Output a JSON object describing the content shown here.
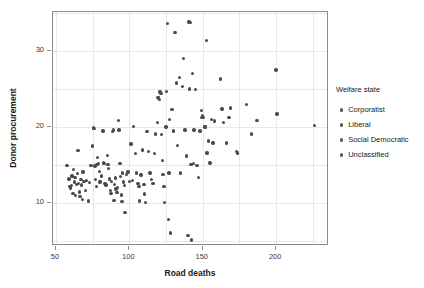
{
  "chart_data": {
    "type": "scatter",
    "title": "",
    "xlabel": "Road deaths",
    "ylabel": "Donor procurement",
    "xlim": [
      48.0,
      236.0
    ],
    "ylim": [
      4.4,
      35.1
    ],
    "xticks": [
      50,
      100,
      150,
      200
    ],
    "yticks": [
      10,
      20,
      30
    ],
    "xtick_labels": [
      "50",
      "100",
      "150",
      "200"
    ],
    "ytick_labels": [
      "10",
      "20",
      "30"
    ],
    "grid": true,
    "grid_color": "#e8e8ea",
    "point_color": "#4a4a52",
    "point_size": 3.4,
    "frame_color": "#8c8c8c",
    "background": "#ffffff",
    "legend": {
      "position": "right",
      "title": "Welfare state",
      "entries": [
        {
          "label": "Corporatist",
          "color": "#595960"
        },
        {
          "label": "Liberal",
          "color": "#595960"
        },
        {
          "label": "Social Democratic",
          "color": "#595960"
        },
        {
          "label": "Unclassified",
          "color": "#595960"
        }
      ]
    },
    "series": [
      {
        "name": "Welfare state",
        "points": [
          [
            57.5,
            15.0
          ],
          [
            59.0,
            13.2
          ],
          [
            59.5,
            12.2
          ],
          [
            60.0,
            12.0
          ],
          [
            60.5,
            12.3
          ],
          [
            61.0,
            13.6
          ],
          [
            61.5,
            11.3
          ],
          [
            62.0,
            14.4
          ],
          [
            62.5,
            12.8
          ],
          [
            63.0,
            13.4
          ],
          [
            63.5,
            11.0
          ],
          [
            64.0,
            12.5
          ],
          [
            64.5,
            13.9
          ],
          [
            65.0,
            16.9
          ],
          [
            65.5,
            12.6
          ],
          [
            66.0,
            11.5
          ],
          [
            66.5,
            10.9
          ],
          [
            67.0,
            13.1
          ],
          [
            67.5,
            12.4
          ],
          [
            68.0,
            10.5
          ],
          [
            68.5,
            14.1
          ],
          [
            69.0,
            12.9
          ],
          [
            70.0,
            11.7
          ],
          [
            71.0,
            13.0
          ],
          [
            72.0,
            10.3
          ],
          [
            73.0,
            12.7
          ],
          [
            74.0,
            15.0
          ],
          [
            75.0,
            17.5
          ],
          [
            75.5,
            19.9
          ],
          [
            76.0,
            19.8
          ],
          [
            76.5,
            14.9
          ],
          [
            77.0,
            13.1
          ],
          [
            77.5,
            12.2
          ],
          [
            78.0,
            15.1
          ],
          [
            78.5,
            16.0
          ],
          [
            79.0,
            15.2
          ],
          [
            79.5,
            14.2
          ],
          [
            80.0,
            12.8
          ],
          [
            80.5,
            12.9
          ],
          [
            81.0,
            13.6
          ],
          [
            82.0,
            19.5
          ],
          [
            82.5,
            15.3
          ],
          [
            83.0,
            15.2
          ],
          [
            83.5,
            12.6
          ],
          [
            84.0,
            12.4
          ],
          [
            85.0,
            16.3
          ],
          [
            85.5,
            15.1
          ],
          [
            86.0,
            14.6
          ],
          [
            86.5,
            13.2
          ],
          [
            87.0,
            11.7
          ],
          [
            87.5,
            11.3
          ],
          [
            88.0,
            12.9
          ],
          [
            88.5,
            19.4
          ],
          [
            89.0,
            19.6
          ],
          [
            89.5,
            10.4
          ],
          [
            90.0,
            12.5
          ],
          [
            90.5,
            13.3
          ],
          [
            91.0,
            11.9
          ],
          [
            91.5,
            11.4
          ],
          [
            92.0,
            12.1
          ],
          [
            92.5,
            20.9
          ],
          [
            93.0,
            19.6
          ],
          [
            93.5,
            15.2
          ],
          [
            94.0,
            13.5
          ],
          [
            94.5,
            11.1
          ],
          [
            95.0,
            10.2
          ],
          [
            95.5,
            14.0
          ],
          [
            96.0,
            12.8
          ],
          [
            96.5,
            12.3
          ],
          [
            97.0,
            8.8
          ],
          [
            98.0,
            13.8
          ],
          [
            99.0,
            14.1
          ],
          [
            100.0,
            12.9
          ],
          [
            101.0,
            17.8
          ],
          [
            102.0,
            13.0
          ],
          [
            103.0,
            20.1
          ],
          [
            104.0,
            16.5
          ],
          [
            105.0,
            14.0
          ],
          [
            106.0,
            12.6
          ],
          [
            106.5,
            12.2
          ],
          [
            107.0,
            10.3
          ],
          [
            108.0,
            13.7
          ],
          [
            109.0,
            17.0
          ],
          [
            110.0,
            12.5
          ],
          [
            110.5,
            11.2
          ],
          [
            111.0,
            10.1
          ],
          [
            112.0,
            19.4
          ],
          [
            113.0,
            16.8
          ],
          [
            114.0,
            14.0
          ],
          [
            115.0,
            13.1
          ],
          [
            116.0,
            12.6
          ],
          [
            117.0,
            16.5
          ],
          [
            118.0,
            19.1
          ],
          [
            119.0,
            20.6
          ],
          [
            119.5,
            23.9
          ],
          [
            120.0,
            23.8
          ],
          [
            120.5,
            23.6
          ],
          [
            121.0,
            24.6
          ],
          [
            121.5,
            24.4
          ],
          [
            122.0,
            19.0
          ],
          [
            122.5,
            15.6
          ],
          [
            123.0,
            13.8
          ],
          [
            123.5,
            12.2
          ],
          [
            124.0,
            10.1
          ],
          [
            125.0,
            20.0
          ],
          [
            125.5,
            24.7
          ],
          [
            126.0,
            33.6
          ],
          [
            126.5,
            7.9
          ],
          [
            127.0,
            14.0
          ],
          [
            127.5,
            21.0
          ],
          [
            128.0,
            6.1
          ],
          [
            129.0,
            22.3
          ],
          [
            130.0,
            19.5
          ],
          [
            131.0,
            32.4
          ],
          [
            132.0,
            25.8
          ],
          [
            133.0,
            17.6
          ],
          [
            134.0,
            26.5
          ],
          [
            135.0,
            14.0
          ],
          [
            136.0,
            25.3
          ],
          [
            137.0,
            29.0
          ],
          [
            138.0,
            19.6
          ],
          [
            139.0,
            16.2
          ],
          [
            140.0,
            5.8
          ],
          [
            140.5,
            33.8
          ],
          [
            141.0,
            25.0
          ],
          [
            141.5,
            33.7
          ],
          [
            142.0,
            15.1
          ],
          [
            142.5,
            5.2
          ],
          [
            143.0,
            27.0
          ],
          [
            143.5,
            15.2
          ],
          [
            144.0,
            19.6
          ],
          [
            145.0,
            24.9
          ],
          [
            146.0,
            15.0
          ],
          [
            147.0,
            13.4
          ],
          [
            148.0,
            19.5
          ],
          [
            149.0,
            22.2
          ],
          [
            149.5,
            21.3
          ],
          [
            150.0,
            21.5
          ],
          [
            150.5,
            21.3
          ],
          [
            151.0,
            20.1
          ],
          [
            151.5,
            20.0
          ],
          [
            152.0,
            20.0
          ],
          [
            152.5,
            31.4
          ],
          [
            153.0,
            16.6
          ],
          [
            154.0,
            18.2
          ],
          [
            155.0,
            15.3
          ],
          [
            156.0,
            21.0
          ],
          [
            157.0,
            17.9
          ],
          [
            158.0,
            20.8
          ],
          [
            162.0,
            26.3
          ],
          [
            163.0,
            22.4
          ],
          [
            164.0,
            20.6
          ],
          [
            166.0,
            17.9
          ],
          [
            168.0,
            21.3
          ],
          [
            169.0,
            22.5
          ],
          [
            173.0,
            16.8
          ],
          [
            173.5,
            16.6
          ],
          [
            180.0,
            23.0
          ],
          [
            183.0,
            19.1
          ],
          [
            187.0,
            20.9
          ],
          [
            200.0,
            27.5
          ],
          [
            200.5,
            21.7
          ],
          [
            226.0,
            20.2
          ]
        ]
      }
    ]
  }
}
